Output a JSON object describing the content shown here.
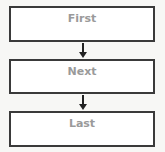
{
  "diagram": {
    "type": "vertical-flowchart",
    "nodes": [
      {
        "label": "First"
      },
      {
        "label": "Next"
      },
      {
        "label": "Last"
      }
    ],
    "edges": [
      {
        "from": 0,
        "to": 1,
        "direction": "down"
      },
      {
        "from": 1,
        "to": 2,
        "direction": "down"
      }
    ],
    "colors": {
      "background": "#f7f7f5",
      "box_border": "#3a3a3a",
      "box_fill": "#ffffff",
      "label_text": "#9a9a9a",
      "arrow": "#222222"
    }
  }
}
